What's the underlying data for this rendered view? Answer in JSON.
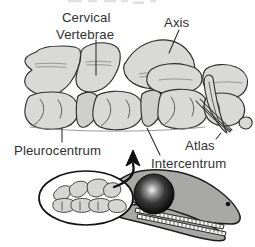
{
  "figure": {
    "title_visible": false,
    "background_color": "#ffffff",
    "bone_fill_color": "#d9d9d7",
    "outline_color": "#2f2f2f",
    "text_color": "#313131",
    "skull_fill_color": "#a8a8a6"
  },
  "labels": {
    "cervical_line1": "Cervical",
    "cervical_line2": "Vertebrae",
    "axis": "Axis",
    "atlas": "Atlas",
    "pleurocentrum": "Pleurocentrum",
    "intercentrum": "Intercentrum"
  },
  "callouts": [
    {
      "name": "cervical-vertebrae",
      "label": "Cervical Vertebrae",
      "target": "upper neural spines of anterior cervical vertebrae"
    },
    {
      "name": "axis",
      "label": "Axis",
      "target": "second cervical vertebra neural arch"
    },
    {
      "name": "atlas",
      "label": "Atlas",
      "target": "first cervical vertebra, posterior right"
    },
    {
      "name": "pleurocentrum",
      "label": "Pleurocentrum",
      "target": "lower vertebral centrum body, left"
    },
    {
      "name": "intercentrum",
      "label": "Intercentrum",
      "target": "wedge element between centra"
    }
  ],
  "inset": {
    "name": "skull-inset",
    "description": "lateral view of reptile skull with highlighted cervical series in oval",
    "eye_color": "#1a1a1a",
    "arrow_direction": "up"
  }
}
